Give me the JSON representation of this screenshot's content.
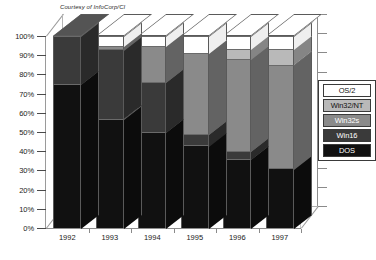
{
  "credit": "Courtesy of InfoCorp/CI",
  "chart_data": {
    "type": "bar",
    "subtype": "100% stacked column (3D)",
    "title": "",
    "xlabel": "",
    "ylabel": "",
    "ylim": [
      0,
      100
    ],
    "ytick_labels": [
      "100%",
      "90%",
      "80%",
      "70%",
      "60%",
      "50%",
      "40%",
      "30%",
      "20%",
      "10%",
      "0%"
    ],
    "ytick_values": [
      100,
      90,
      80,
      70,
      60,
      50,
      40,
      30,
      20,
      10,
      0
    ],
    "grid": false,
    "legend_position": "right",
    "categories": [
      "1992",
      "1993",
      "1994",
      "1995",
      "1996",
      "1997"
    ],
    "series": [
      {
        "name": "DOS",
        "color": "#111111",
        "values": [
          75,
          57,
          50,
          43,
          36,
          31
        ]
      },
      {
        "name": "Win16",
        "color": "#3a3a3a",
        "values": [
          25,
          36,
          26,
          6,
          4,
          0
        ]
      },
      {
        "name": "Win32s",
        "color": "#8a8a8a",
        "values": [
          0,
          2,
          19,
          42,
          48,
          54
        ]
      },
      {
        "name": "Win32/NT",
        "color": "#b9b9b9",
        "values": [
          0,
          0,
          0,
          0,
          5,
          8
        ]
      },
      {
        "name": "OS/2",
        "color": "#ffffff",
        "values": [
          0,
          5,
          5,
          9,
          7,
          7
        ]
      }
    ]
  },
  "legend": {
    "items": [
      {
        "label": "OS/2",
        "color": "#ffffff",
        "text_color": "#111111"
      },
      {
        "label": "Win32/NT",
        "color": "#b9b9b9",
        "text_color": "#111111"
      },
      {
        "label": "Win32s",
        "color": "#8a8a8a",
        "text_color": "#ffffff"
      },
      {
        "label": "Win16",
        "color": "#3a3a3a",
        "text_color": "#ffffff"
      },
      {
        "label": "DOS",
        "color": "#111111",
        "text_color": "#ffffff"
      }
    ]
  }
}
